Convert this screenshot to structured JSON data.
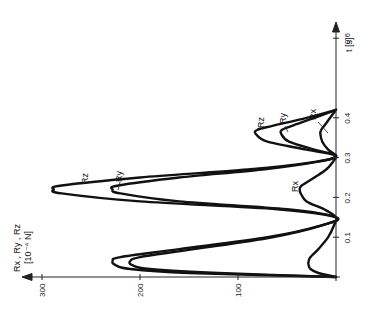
{
  "chart_data": {
    "type": "line",
    "orientation": "rotated-90-ccw",
    "title": "",
    "xlabel": "t [s]",
    "ylabel": "R_x, R_y, R_z [10^-4 N]",
    "ylabel_line1": "Rx , Ry , Rz",
    "ylabel_line2": "[10⁻⁴ N]",
    "xlabel_text": "t [s]",
    "xlim": [
      0,
      0.7
    ],
    "ylim": [
      0,
      320
    ],
    "x_ticks": [
      0.1,
      0.2,
      0.3,
      0.4,
      0.6
    ],
    "x_tick_labels": [
      "0.1",
      "0.2",
      "0.3",
      "0.4",
      "0.6"
    ],
    "y_ticks": [
      100,
      200,
      300
    ],
    "y_tick_labels": [
      "100",
      "200",
      "300"
    ],
    "grid": false,
    "legend": "inline annotations",
    "x": [
      0,
      0.01,
      0.02,
      0.03,
      0.04,
      0.05,
      0.07,
      0.1,
      0.13,
      0.15,
      0.17,
      0.19,
      0.21,
      0.22,
      0.23,
      0.25,
      0.27,
      0.29,
      0.305,
      0.32,
      0.34,
      0.36,
      0.37,
      0.38,
      0.4,
      0.42
    ],
    "series": [
      {
        "name": "Rz",
        "label": "Rz",
        "values": [
          0,
          150,
          210,
          225,
          228,
          220,
          160,
          70,
          15,
          0,
          60,
          200,
          280,
          288,
          280,
          200,
          90,
          20,
          0,
          30,
          70,
          82,
          80,
          65,
          30,
          0
        ]
      },
      {
        "name": "Ry",
        "label": "Ry",
        "values": [
          0,
          120,
          190,
          208,
          210,
          200,
          145,
          65,
          14,
          0,
          50,
          160,
          220,
          228,
          222,
          160,
          75,
          18,
          0,
          22,
          48,
          56,
          55,
          45,
          22,
          0
        ]
      },
      {
        "name": "Rx",
        "label": "Rx",
        "values": [
          0,
          18,
          26,
          28,
          28,
          26,
          18,
          8,
          2,
          0,
          12,
          30,
          36,
          37,
          35,
          22,
          10,
          3,
          0,
          8,
          14,
          16,
          15,
          12,
          6,
          0
        ]
      }
    ],
    "annotations": [
      {
        "text": "Rz",
        "near": "peak 2"
      },
      {
        "text": "Ry",
        "near": "peak 2"
      },
      {
        "text": "Rx",
        "near": "trough 0.2"
      },
      {
        "text": "Rz",
        "near": "peak 3"
      },
      {
        "text": "Ry",
        "near": "peak 3"
      },
      {
        "text": "Rx",
        "near": "peak 3"
      }
    ]
  }
}
